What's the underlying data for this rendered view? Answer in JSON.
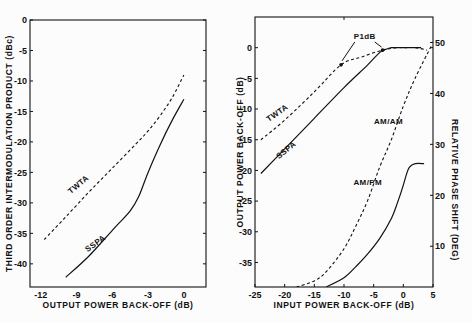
{
  "chart_data": [
    {
      "type": "line",
      "id": "imd",
      "title": "",
      "xlabel": "OUTPUT POWER BACK-OFF (dB)",
      "ylabel": "THIRD ORDER INTERMODULATION PRODUCT (dBc)",
      "xlim": [
        -12.9,
        1.85
      ],
      "ylim": [
        -43.8,
        0
      ],
      "xticks": [
        -12,
        -9,
        -6,
        -3,
        0
      ],
      "yticks": [
        0,
        -5,
        -10,
        -15,
        -20,
        -25,
        -30,
        -35,
        -40
      ],
      "grid": false,
      "series": [
        {
          "name": "TWTA",
          "style": "dashed",
          "x": [
            -11.7,
            -10,
            -8,
            -6,
            -4,
            -3,
            -2,
            -1,
            0
          ],
          "y": [
            -36.0,
            -32.5,
            -28.3,
            -24.3,
            -20.3,
            -18.2,
            -15.7,
            -12.8,
            -9.0
          ]
        },
        {
          "name": "SSPA",
          "style": "solid",
          "x": [
            -9.9,
            -8,
            -6,
            -4.5,
            -3.8,
            -3,
            -2,
            -1,
            0
          ],
          "y": [
            -42.2,
            -38.8,
            -34.5,
            -31.3,
            -29.0,
            -25.0,
            -20.5,
            -16.5,
            -13.0
          ]
        }
      ],
      "annotations": [
        {
          "text": "TWTA",
          "x": -8.6,
          "y": -27.5
        },
        {
          "text": "SSPA",
          "x": -7.2,
          "y": -37.5
        }
      ]
    },
    {
      "type": "line",
      "id": "amam_ampm",
      "title": "",
      "xlabel": "INPUT POWER BACK-OFF (dB)",
      "ylabel": "OUTPUT POWER BACK-OFF (dB)",
      "y2label": "RELATIVE PHASE SHIFT (DEG)",
      "xlim": [
        -25,
        5
      ],
      "ylim": [
        -39,
        5
      ],
      "y2lim": [
        2,
        55
      ],
      "xticks": [
        -25,
        -20,
        -15,
        -10,
        -5,
        0,
        5
      ],
      "yticks": [
        0,
        -5,
        -10,
        -15,
        -20,
        -25,
        -30,
        -35
      ],
      "y2ticks": [
        10,
        20,
        30,
        40,
        50
      ],
      "grid": false,
      "series": [
        {
          "name": "TWTA AM/AM",
          "axis": "left",
          "style": "dashed",
          "x": [
            -24,
            -20,
            -15,
            -10.5,
            -7,
            -3.5,
            -1,
            0,
            2,
            4
          ],
          "y": [
            -15.0,
            -11.8,
            -7.2,
            -2.8,
            -1.5,
            -0.4,
            0.0,
            0.0,
            0.0,
            -0.4
          ]
        },
        {
          "name": "SSPA AM/AM",
          "axis": "left",
          "style": "solid",
          "x": [
            -24,
            -20,
            -15,
            -10,
            -6,
            -4,
            -3,
            -2,
            -1,
            0,
            3
          ],
          "y": [
            -20.5,
            -16.5,
            -11.5,
            -6.5,
            -2.8,
            -0.8,
            -0.3,
            0.0,
            0.0,
            0.0,
            0.0
          ]
        },
        {
          "name": "TWTA AM/PM",
          "axis": "right",
          "style": "dashed",
          "x": [
            -18,
            -15,
            -13,
            -10,
            -8,
            -6,
            -4,
            -2,
            0,
            2,
            4.8
          ],
          "y": [
            2.0,
            3.2,
            5.0,
            9.5,
            14.0,
            19.0,
            25.5,
            31.0,
            37.5,
            43.0,
            49.5
          ]
        },
        {
          "name": "SSPA AM/PM",
          "axis": "right",
          "style": "solid",
          "x": [
            -13,
            -10,
            -8,
            -6,
            -4,
            -2,
            -1,
            0,
            0.5,
            1,
            2,
            3.5
          ],
          "y": [
            2.0,
            3.8,
            6.0,
            8.5,
            11.5,
            15.5,
            18.5,
            22.0,
            24.0,
            25.5,
            26.2,
            26.2
          ]
        }
      ],
      "annotations": [
        {
          "text": "P1dB",
          "x": -6.5,
          "y": 3.0
        },
        {
          "text": "AM/AM",
          "x": -2.5,
          "y": -12.5
        },
        {
          "text": "AM/PM",
          "axis": "right",
          "x": -6,
          "y": 22
        },
        {
          "text": "TWTA",
          "x": -21,
          "y": -11
        },
        {
          "text": "SSPA",
          "x": -19.5,
          "y": -17
        }
      ],
      "markers": [
        {
          "label": "P1dB TWTA",
          "x": -10.5,
          "y": -2.8
        },
        {
          "label": "P1dB SSPA",
          "x": -3.5,
          "y": -0.4
        }
      ]
    }
  ]
}
